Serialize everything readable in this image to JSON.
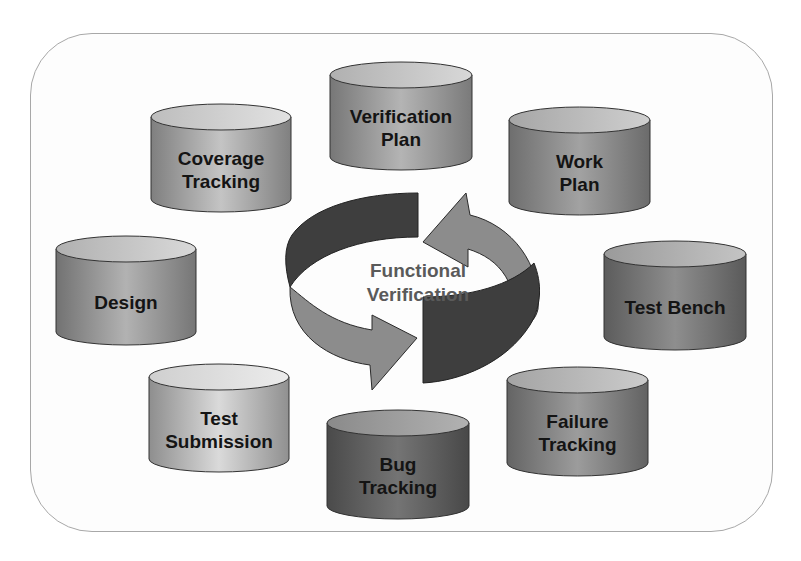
{
  "diagram": {
    "title": "Functional Verification",
    "center_label": "Functional\nVerification",
    "nodes": [
      {
        "id": "verification-plan",
        "label": "Verification\nPlan",
        "color": "#9a9a9a"
      },
      {
        "id": "work-plan",
        "label": "Work\nPlan",
        "color": "#8a8a8a"
      },
      {
        "id": "test-bench",
        "label": "Test Bench",
        "color": "#7a7a7a"
      },
      {
        "id": "failure-tracking",
        "label": "Failure\nTracking",
        "color": "#858585"
      },
      {
        "id": "bug-tracking",
        "label": "Bug\nTracking",
        "color": "#666666"
      },
      {
        "id": "test-submission",
        "label": "Test\nSubmission",
        "color": "#b5b5b5"
      },
      {
        "id": "design",
        "label": "Design",
        "color": "#9c9c9c"
      },
      {
        "id": "coverage-tracking",
        "label": "Coverage\nTracking",
        "color": "#a5a5a5"
      }
    ],
    "cycle_arrows": [
      {
        "id": "top-dark-band",
        "color": "#404040"
      },
      {
        "id": "right-arrow",
        "color": "#8c8c8c"
      },
      {
        "id": "left-arrow",
        "color": "#8c8c8c"
      },
      {
        "id": "bottom-dark-band",
        "color": "#404040"
      }
    ]
  }
}
